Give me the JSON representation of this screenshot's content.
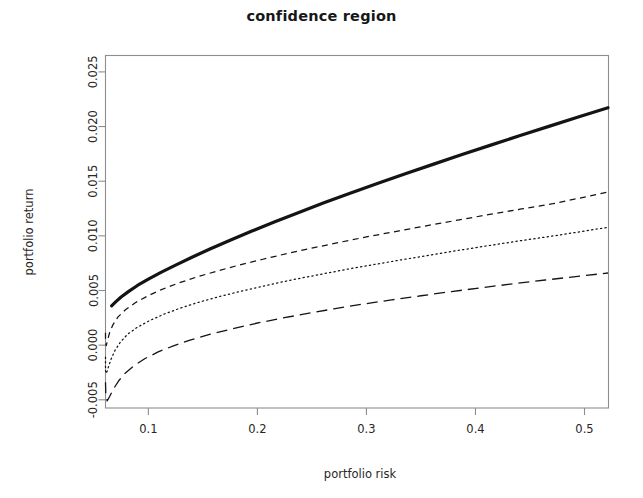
{
  "chart_data": {
    "type": "line",
    "title": "confidence region",
    "xlabel": "portfolio risk",
    "ylabel": "portfolio return",
    "xlim": [
      0.0607,
      0.522
    ],
    "ylim": [
      -0.00575,
      0.0265
    ],
    "xticks": [
      0.1,
      0.2,
      0.3,
      0.4,
      0.5
    ],
    "xtick_labels": [
      "0.1",
      "0.2",
      "0.3",
      "0.4",
      "0.5"
    ],
    "yticks": [
      -0.005,
      0.0,
      0.005,
      0.01,
      0.015,
      0.02,
      0.025
    ],
    "ytick_labels": [
      "-0.005",
      "0.000",
      "0.005",
      "0.010",
      "0.015",
      "0.020",
      "0.025"
    ],
    "grid": false,
    "legend": "none",
    "series": [
      {
        "name": "efficient frontier",
        "style": "solid",
        "linewidth": 3.2,
        "color": "#141414",
        "x": [
          0.0663,
          0.07,
          0.075,
          0.082,
          0.09,
          0.1,
          0.112,
          0.125,
          0.14,
          0.157,
          0.175,
          0.195,
          0.216,
          0.238,
          0.261,
          0.285,
          0.31,
          0.335,
          0.361,
          0.387,
          0.414,
          0.441,
          0.468,
          0.495,
          0.5215
        ],
        "y": [
          0.0036,
          0.00396,
          0.0044,
          0.00492,
          0.00546,
          0.00604,
          0.00668,
          0.00732,
          0.00804,
          0.00882,
          0.0096,
          0.01044,
          0.01128,
          0.01214,
          0.01302,
          0.0139,
          0.01478,
          0.01566,
          0.01654,
          0.01742,
          0.0183,
          0.01918,
          0.02004,
          0.0209,
          0.02172
        ]
      },
      {
        "name": "upper confidence bound",
        "style": "short-dash",
        "linewidth": 1.25,
        "color": "#141414",
        "x": [
          0.0607,
          0.0607,
          0.0614,
          0.0625,
          0.0645,
          0.0675,
          0.072,
          0.079,
          0.088,
          0.099,
          0.112,
          0.127,
          0.144,
          0.163,
          0.183,
          0.205,
          0.228,
          0.252,
          0.277,
          0.303,
          0.33,
          0.357,
          0.385,
          0.413,
          0.442,
          0.471,
          0.5215
        ],
        "y": [
          0.00113,
          0.00027,
          -5e-05,
          0.00042,
          0.00116,
          0.00186,
          0.00256,
          0.00324,
          0.00388,
          0.00448,
          0.00508,
          0.00566,
          0.00622,
          0.00678,
          0.00732,
          0.00786,
          0.0084,
          0.00892,
          0.00944,
          0.00996,
          0.01046,
          0.01096,
          0.01146,
          0.01196,
          0.01246,
          0.01294,
          0.014
        ]
      },
      {
        "name": "mean estimate",
        "style": "dotted",
        "linewidth": 1.25,
        "color": "#141414",
        "x": [
          0.0607,
          0.0607,
          0.0616,
          0.0632,
          0.0658,
          0.0695,
          0.0745,
          0.081,
          0.09,
          0.101,
          0.114,
          0.129,
          0.146,
          0.165,
          0.186,
          0.208,
          0.231,
          0.256,
          0.281,
          0.307,
          0.334,
          0.362,
          0.39,
          0.418,
          0.447,
          0.476,
          0.5215
        ],
        "y": [
          -0.0011,
          -0.00235,
          -0.0026,
          -0.00205,
          -0.00128,
          -0.00046,
          0.0003,
          0.001,
          0.00164,
          0.00224,
          0.00282,
          0.00338,
          0.00392,
          0.00444,
          0.00496,
          0.00546,
          0.00596,
          0.00644,
          0.00692,
          0.00738,
          0.00784,
          0.0083,
          0.00876,
          0.0092,
          0.00964,
          0.01006,
          0.01078
        ]
      },
      {
        "name": "lower confidence bound",
        "style": "long-dash",
        "linewidth": 1.3,
        "color": "#141414",
        "x": [
          0.0607,
          0.061,
          0.0622,
          0.0645,
          0.068,
          0.0728,
          0.079,
          0.087,
          0.097,
          0.109,
          0.123,
          0.139,
          0.157,
          0.177,
          0.198,
          0.221,
          0.245,
          0.27,
          0.296,
          0.323,
          0.35,
          0.378,
          0.406,
          0.435,
          0.464,
          0.5215
        ],
        "y": [
          -0.0034,
          -0.0046,
          -0.0051,
          -0.0047,
          -0.004,
          -0.00326,
          -0.00254,
          -0.00186,
          -0.00122,
          -0.00062,
          -6e-05,
          0.00048,
          0.001,
          0.0015,
          0.00198,
          0.00244,
          0.00288,
          0.00332,
          0.00374,
          0.00414,
          0.00452,
          0.0049,
          0.00526,
          0.00562,
          0.00596,
          0.0066
        ]
      }
    ]
  }
}
